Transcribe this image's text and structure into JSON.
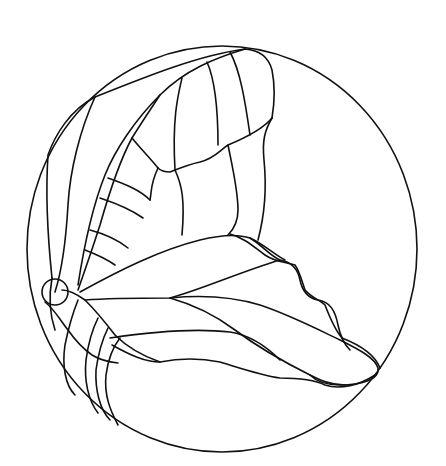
{
  "image": {
    "title": "Butterfly stained-glass line pattern in circle",
    "background": "#ffffff",
    "stroke_color": "#111111"
  },
  "elements": {
    "frame": "circular-border",
    "upper_wing": "upper-wing-outline",
    "lower_wing": "lower-wing-outline",
    "body": "butterfly-body",
    "head": "butterfly-head"
  }
}
